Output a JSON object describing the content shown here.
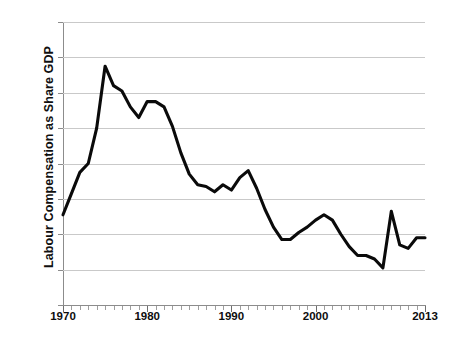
{
  "chart_data": {
    "type": "line",
    "title": "",
    "xlabel": "",
    "ylabel": "Labour Compensation as Share GDP",
    "ylim": [
      48,
      56
    ],
    "xlim": [
      1970,
      2013
    ],
    "grid": true,
    "legend": false,
    "y_tick_labels": [
      "56%",
      "55%",
      "54%",
      "53%",
      "52%",
      "51%",
      "50%",
      "49%",
      "48%"
    ],
    "y_tick_values": [
      56,
      55,
      54,
      53,
      52,
      51,
      50,
      49,
      48
    ],
    "x_tick_labels": [
      "1970",
      "1980",
      "1990",
      "2000",
      "2013"
    ],
    "x_tick_values": [
      1970,
      1980,
      1990,
      2000,
      2013
    ],
    "x_minor_tick_step": 1,
    "series": [
      {
        "name": "Labour Compensation as Share GDP",
        "color": "#0a0a0a",
        "x": [
          1970,
          1971,
          1972,
          1973,
          1974,
          1975,
          1976,
          1977,
          1978,
          1979,
          1980,
          1981,
          1982,
          1983,
          1984,
          1985,
          1986,
          1987,
          1988,
          1989,
          1990,
          1991,
          1992,
          1993,
          1994,
          1995,
          1996,
          1997,
          1998,
          1999,
          2000,
          2001,
          2002,
          2003,
          2004,
          2005,
          2006,
          2007,
          2008,
          2009,
          2010,
          2011,
          2012,
          2013
        ],
        "values": [
          50.55,
          51.15,
          51.75,
          52.0,
          53.0,
          54.75,
          54.2,
          54.05,
          53.6,
          53.3,
          53.75,
          53.75,
          53.6,
          53.05,
          52.3,
          51.7,
          51.4,
          51.35,
          51.2,
          51.4,
          51.25,
          51.6,
          51.8,
          51.3,
          50.7,
          50.2,
          49.85,
          49.85,
          50.05,
          50.2,
          50.4,
          50.55,
          50.4,
          50.0,
          49.65,
          49.4,
          49.4,
          49.3,
          49.05,
          50.65,
          49.7,
          49.6,
          49.9,
          49.9
        ]
      }
    ]
  },
  "axis": {
    "y_title": "Labour Compensation as Share GDP"
  },
  "caption": {
    "text": ""
  }
}
